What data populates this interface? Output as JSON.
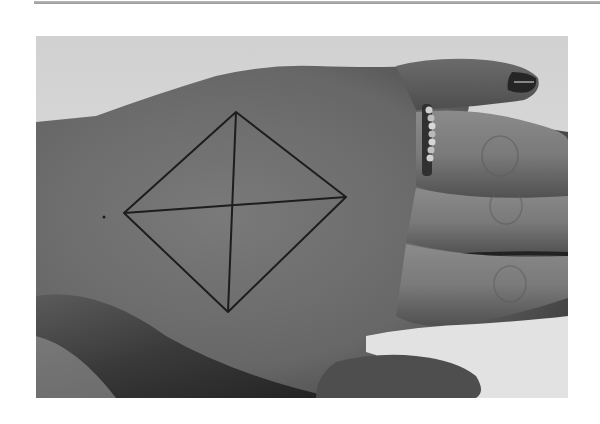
{
  "page": {
    "top_rule": {
      "color": "#a8a8a8"
    }
  },
  "photo": {
    "description": "Black-and-white photograph of the back of a hand with a diamond drawn in ink, divided by two crossing diagonals; a beaded ring on the ring finger and dark polish on a fingernail",
    "colors": {
      "background": "#e6e6e6",
      "skin_mid": "#6e6e6e",
      "skin_dark": "#2a2a2a",
      "skin_light": "#8a8a8a",
      "ink": "#151515",
      "nail": "#1e1e1e",
      "ring": "#bdbdbd"
    },
    "diamond": {
      "top": [
        200,
        76
      ],
      "right": [
        310,
        161
      ],
      "bottom": [
        192,
        276
      ],
      "left": [
        88,
        177
      ]
    },
    "dot": [
      68,
      181
    ]
  }
}
